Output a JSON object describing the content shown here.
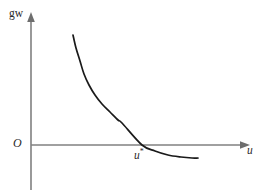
{
  "figure": {
    "background_color": "#ffffff",
    "width": 261,
    "height": 196,
    "axis_color": "#808080",
    "curve_color": "#1a1a1a",
    "label_color": "#2a2a2a"
  },
  "labels": {
    "y_axis": "gw",
    "x_axis": "u",
    "origin": "O",
    "equilibrium": "u",
    "equilibrium_superscript": "*"
  },
  "chart_data": {
    "type": "line",
    "title": "",
    "subtitle": "",
    "xlabel": "u",
    "ylabel": "gw",
    "grid": false,
    "legend": null,
    "annotations": [
      {
        "text": "O",
        "role": "origin-label",
        "x": 0,
        "y": 0
      },
      {
        "text": "u*",
        "role": "x-axis-crossing-label",
        "x": 0.56,
        "y": 0
      }
    ],
    "axes": {
      "x_range": [
        0,
        1.0
      ],
      "y_range": [
        -0.16,
        1.0
      ],
      "x_arrow": true,
      "y_arrow": true,
      "x_ticks": [],
      "y_ticks": [],
      "origin_px": {
        "x": 31,
        "y": 145
      }
    },
    "series": [
      {
        "name": "gw(u)",
        "style": "solid",
        "color": "#1a1a1a",
        "description": "Monotonically decreasing convex curve; starts high at small u, falls steeply, crosses zero at u*, then flattens toward a small negative asymptote.",
        "x": [
          0.195,
          0.215,
          0.24,
          0.27,
          0.305,
          0.345,
          0.39,
          0.44,
          0.495,
          0.515,
          0.56,
          0.62,
          0.69,
          0.77,
          0.855,
          0.925
        ],
        "y": [
          0.905,
          0.79,
          0.672,
          0.56,
          0.46,
          0.372,
          0.292,
          0.218,
          0.148,
          0.122,
          0.0,
          -0.052,
          -0.09,
          -0.113,
          -0.123,
          -0.125
        ],
        "points_px": [
          {
            "x": 73,
            "y": 35
          },
          {
            "x": 76,
            "y": 48
          },
          {
            "x": 80,
            "y": 61
          },
          {
            "x": 84,
            "y": 74
          },
          {
            "x": 89,
            "y": 85
          },
          {
            "x": 95,
            "y": 95
          },
          {
            "x": 102,
            "y": 104
          },
          {
            "x": 110,
            "y": 112
          },
          {
            "x": 118,
            "y": 120
          },
          {
            "x": 122,
            "y": 123
          },
          {
            "x": 142,
            "y": 145
          },
          {
            "x": 155,
            "y": 151
          },
          {
            "x": 168,
            "y": 155
          },
          {
            "x": 181,
            "y": 157
          },
          {
            "x": 192,
            "y": 158
          },
          {
            "x": 198,
            "y": 158
          }
        ]
      }
    ]
  }
}
